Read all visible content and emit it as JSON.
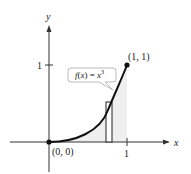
{
  "figure": {
    "axes": {
      "x_label": "x",
      "y_label": "y",
      "x_tick": "1",
      "y_tick": "1"
    },
    "function_label": {
      "f": "f",
      "paren_open": "(",
      "var": "x",
      "paren_close": ") = ",
      "rhs_var": "x",
      "exponent": "3"
    },
    "points": [
      {
        "label": "(0, 0)",
        "x": 0,
        "y": 0
      },
      {
        "label": "(1, 1)",
        "x": 1,
        "y": 1
      }
    ],
    "colors": {
      "curve": "#111111",
      "shaded_region": "#eeeeee",
      "callout_border": "#bbbbbb",
      "callout_text": "#9a9a9a",
      "axis": "#333333"
    },
    "representative_rectangle": {
      "x_from": 0.73,
      "x_to": 0.8
    }
  }
}
